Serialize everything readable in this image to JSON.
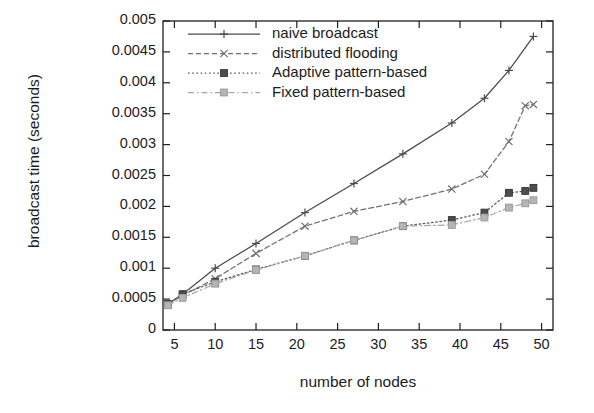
{
  "chart_data": {
    "type": "line",
    "title": "",
    "xlabel": "number of nodes",
    "ylabel": "broadcast time (seconds)",
    "xlim": [
      3.6,
      51.4
    ],
    "ylim": [
      0,
      0.005
    ],
    "xticks": [
      5,
      10,
      15,
      20,
      25,
      30,
      35,
      40,
      45,
      50
    ],
    "yticks": [
      0,
      0.0005,
      0.001,
      0.0015,
      0.002,
      0.0025,
      0.003,
      0.0035,
      0.004,
      0.0045,
      0.005
    ],
    "ytick_labels": [
      "0",
      "0.0005",
      "0.001",
      "0.0015",
      "0.002",
      "0.0025",
      "0.003",
      "0.0035",
      "0.004",
      "0.0045",
      "0.005"
    ],
    "xtick_labels": [
      "5",
      "10",
      "15",
      "20",
      "25",
      "30",
      "35",
      "40",
      "45",
      "50"
    ],
    "grid": false,
    "legend_position": "top-left inside",
    "series": [
      {
        "name": "naive broadcast",
        "marker": "plus",
        "dash": "solid",
        "color": "#4a4a4a",
        "x": [
          4.2,
          6,
          10,
          15,
          21,
          27,
          33,
          39,
          43,
          46,
          49
        ],
        "y": [
          0.00042,
          0.00058,
          0.001,
          0.0014,
          0.0019,
          0.00237,
          0.00285,
          0.00335,
          0.00375,
          0.0042,
          0.00475
        ]
      },
      {
        "name": "distributed flooding",
        "marker": "cross",
        "dash": "dashed",
        "color": "#707070",
        "x": [
          4.2,
          6,
          10,
          15,
          21,
          27,
          33,
          39,
          43,
          46,
          48,
          49
        ],
        "y": [
          0.00042,
          0.00056,
          0.00083,
          0.00124,
          0.00168,
          0.00192,
          0.00208,
          0.00228,
          0.00252,
          0.00305,
          0.00363,
          0.00365
        ]
      },
      {
        "name": "Adaptive pattern-based",
        "marker": "square-filled",
        "dash": "dotted",
        "color": "#5a5a5a",
        "x": [
          4.2,
          6,
          10,
          15,
          21,
          27,
          33,
          39,
          43,
          46,
          48,
          49
        ],
        "y": [
          0.00042,
          0.00058,
          0.00078,
          0.00098,
          0.0012,
          0.00145,
          0.00168,
          0.00178,
          0.0019,
          0.00222,
          0.00225,
          0.0023
        ]
      },
      {
        "name": "Fixed pattern-based",
        "marker": "square-light",
        "dash": "dashdot",
        "color": "#a6a6a6",
        "x": [
          4.2,
          6,
          10,
          15,
          21,
          27,
          33,
          39,
          43,
          46,
          48,
          49
        ],
        "y": [
          0.0004,
          0.00052,
          0.00075,
          0.00097,
          0.0012,
          0.00145,
          0.00168,
          0.0017,
          0.00182,
          0.00198,
          0.00205,
          0.0021
        ]
      }
    ]
  },
  "legend": {
    "entries": [
      {
        "label": "naive broadcast"
      },
      {
        "label": "distributed flooding"
      },
      {
        "label": "Adaptive pattern-based"
      },
      {
        "label": "Fixed pattern-based"
      }
    ]
  }
}
